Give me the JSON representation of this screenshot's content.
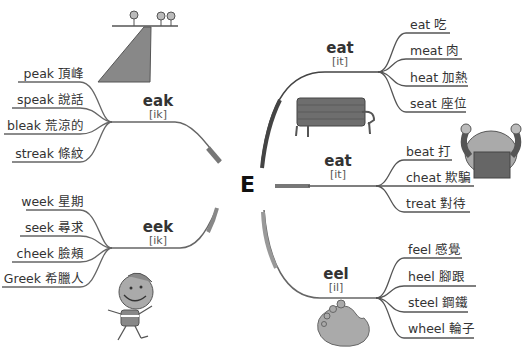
{
  "center": {
    "letter": "E"
  },
  "branches": {
    "eak": {
      "pattern": "eak",
      "phonetic": "[ik]",
      "words": [
        {
          "label": "peak 頂峰"
        },
        {
          "label": "speak 說話"
        },
        {
          "label": "bleak 荒涼的"
        },
        {
          "label": "streak 條紋"
        }
      ]
    },
    "eek": {
      "pattern": "eek",
      "phonetic": "[ik]",
      "words": [
        {
          "label": "week 星期"
        },
        {
          "label": "seek 尋求"
        },
        {
          "label": "cheek 臉頰"
        },
        {
          "label": "Greek 希臘人"
        }
      ]
    },
    "eat1": {
      "pattern": "eat",
      "phonetic": "[it]",
      "words": [
        {
          "label": "eat 吃"
        },
        {
          "label": "meat 肉"
        },
        {
          "label": "heat 加熱"
        },
        {
          "label": "seat 座位"
        }
      ]
    },
    "eat2": {
      "pattern": "eat",
      "phonetic": "[it]",
      "words": [
        {
          "label": "beat 打"
        },
        {
          "label": "cheat 欺騙"
        },
        {
          "label": "treat 對待"
        }
      ]
    },
    "eel": {
      "pattern": "eel",
      "phonetic": "[il]",
      "words": [
        {
          "label": "feel 感覺"
        },
        {
          "label": "heel 腳跟"
        },
        {
          "label": "steel 鋼鐵"
        },
        {
          "label": "wheel 輪子"
        }
      ]
    }
  },
  "colors": {
    "line": "#555555",
    "illustration_fill": "#8a8a8a",
    "illustration_dark": "#666666",
    "text": "#333333"
  }
}
